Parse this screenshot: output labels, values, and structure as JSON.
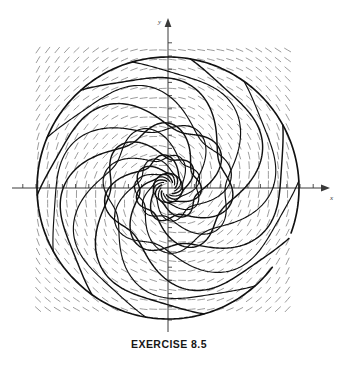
{
  "figure": {
    "caption": "EXERCISE 8.5",
    "background_color": "#ffffff",
    "width": 338,
    "height": 365
  },
  "axes": {
    "x_label": "x",
    "y_label": "y",
    "axis_color": "#3a3a3a",
    "origin": {
      "x": 168,
      "y": 188
    },
    "x_axis": {
      "x_start": 12,
      "x_end": 330,
      "arrow": "right"
    },
    "y_axis": {
      "y_start": 18,
      "y_end": 332,
      "arrow": "up"
    },
    "tick_spacing_px": 13.2,
    "tick_length_px": 4,
    "x_tick_count_each_side": 11,
    "y_tick_count_each_side": 11
  },
  "slope_field": {
    "description": "grid of short curved dash segments showing direction field",
    "color": "#8a8a8a",
    "dash_color_dark": "#6f6f6f",
    "x_min": 38,
    "x_max": 297,
    "y_min": 50,
    "y_max": 310,
    "grid_step_px": 9.6,
    "dash_length_px": 7.0,
    "stroke_width": 0.85
  },
  "solution_curves": {
    "color": "#111111",
    "stroke_width": 1.45,
    "type": "logarithmic-spiral-family",
    "arm_count": 7,
    "turns": 1.08,
    "r_outer_px": 131,
    "r_inner_px": 7,
    "growth_b": 0.47,
    "petal_amplitude": 0.3,
    "petal_lobes": 7,
    "outer_boundary_circle": {
      "center_x": 168,
      "center_y": 188,
      "radius_px": 131,
      "present": true
    }
  },
  "chart_data": {
    "type": "line",
    "title": "EXERCISE 8.5",
    "xlabel": "x",
    "ylabel": "y",
    "grid": false,
    "legend": null,
    "xlim": [
      -11,
      11
    ],
    "ylim": [
      -11,
      11
    ],
    "series": [
      {
        "name": "spiral-arm-1",
        "start_angle_deg": 0,
        "description": "solution trajectory spiralling outward from origin"
      },
      {
        "name": "spiral-arm-2",
        "start_angle_deg": 51,
        "description": "solution trajectory spiralling outward from origin"
      },
      {
        "name": "spiral-arm-3",
        "start_angle_deg": 103,
        "description": "solution trajectory spiralling outward from origin"
      },
      {
        "name": "spiral-arm-4",
        "start_angle_deg": 154,
        "description": "solution trajectory spiralling outward from origin"
      },
      {
        "name": "spiral-arm-5",
        "start_angle_deg": 206,
        "description": "solution trajectory spiralling outward from origin"
      },
      {
        "name": "spiral-arm-6",
        "start_angle_deg": 257,
        "description": "solution trajectory spiralling outward from origin"
      },
      {
        "name": "spiral-arm-7",
        "start_angle_deg": 309,
        "description": "solution trajectory spiralling outward from origin"
      }
    ],
    "annotations": [
      {
        "text": "x",
        "position": "right end of horizontal axis"
      },
      {
        "text": "y",
        "position": "top end of vertical axis"
      }
    ]
  }
}
